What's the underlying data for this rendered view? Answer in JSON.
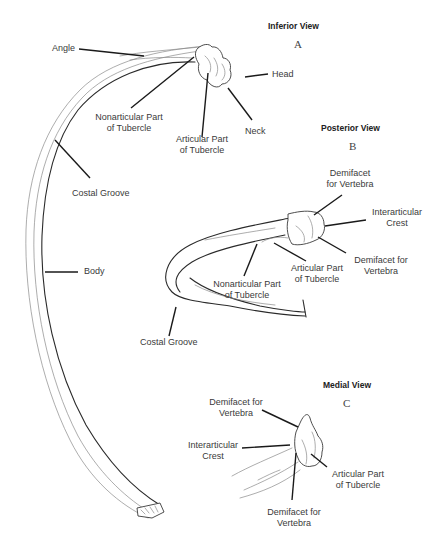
{
  "views": [
    {
      "id": "A",
      "title": "Inferior View",
      "letter": "A",
      "labels": {
        "angle": "Angle",
        "head": "Head",
        "nonarticular_1": "Nonarticular Part",
        "nonarticular_2": "of Tubercle",
        "articular_1": "Articular Part",
        "articular_2": "of Tubercle",
        "neck": "Neck",
        "costal_groove": "Costal Groove",
        "body": "Body"
      }
    },
    {
      "id": "B",
      "title": "Posterior View",
      "letter": "B",
      "labels": {
        "demifacet_top_1": "Demifacet",
        "demifacet_top_2": "for Vertebra",
        "interarticular_1": "Interarticular",
        "interarticular_2": "Crest",
        "demifacet_bottom_1": "Demifacet for",
        "demifacet_bottom_2": "Vertebra",
        "articular_1": "Articular Part",
        "articular_2": "of Tubercle",
        "nonarticular_1": "Nonarticular Part",
        "nonarticular_2": "of Tubercle",
        "costal_groove": "Costal Groove"
      }
    },
    {
      "id": "C",
      "title": "Medial View",
      "letter": "C",
      "labels": {
        "demifacet_top_1": "Demifacet for",
        "demifacet_top_2": "Vertebra",
        "interarticular_1": "Interarticular",
        "interarticular_2": "Crest",
        "articular_1": "Articular Part",
        "articular_2": "of Tubercle",
        "demifacet_bottom_1": "Demifacet for",
        "demifacet_bottom_2": "Vertebra"
      }
    }
  ]
}
